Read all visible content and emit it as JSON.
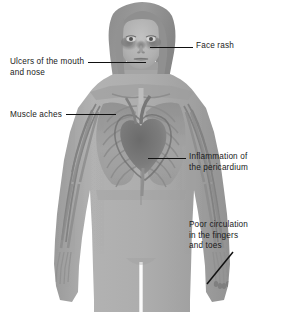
{
  "figure": {
    "background_color": "#ffffff",
    "line_color": "#111111",
    "text_color": "#1a1a1a",
    "body_fill": "#a8a8a8"
  },
  "callouts": [
    {
      "id": "face-rash",
      "text": "Face rash",
      "side": "right",
      "leader": "horizontal",
      "target": "cheeks-and-nose"
    },
    {
      "id": "ulcers",
      "text": "Ulcers of the mouth\nand nose",
      "side": "left",
      "leader": "horizontal",
      "target": "mouth-and-nose"
    },
    {
      "id": "muscle-aches",
      "text": "Muscle aches",
      "side": "left",
      "leader": "horizontal",
      "target": "chest-muscles"
    },
    {
      "id": "pericarditis",
      "text": "Inflammation of\nthe pericardium",
      "side": "right",
      "leader": "horizontal",
      "target": "heart-pericardium"
    },
    {
      "id": "poor-circulation",
      "text": "Poor circulation\nin the fingers\nand toes",
      "side": "right",
      "leader": "diagonal",
      "target": "left-hand-fingers"
    }
  ]
}
